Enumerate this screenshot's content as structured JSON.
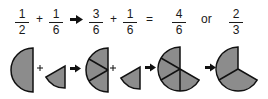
{
  "equation": {
    "terms": [
      {
        "numerator": "1",
        "denominator": "2"
      },
      {
        "numerator": "1",
        "denominator": "6"
      },
      {
        "numerator": "3",
        "denominator": "6"
      },
      {
        "numerator": "1",
        "denominator": "6"
      },
      {
        "numerator": "4",
        "denominator": "6"
      },
      {
        "numerator": "2",
        "denominator": "3"
      }
    ],
    "operators": {
      "plus_1": "+",
      "plus_2": "+",
      "equals": "=",
      "or_word": "or"
    }
  },
  "pictorial": {
    "plus_1": "+",
    "plus_2": "+",
    "shapes": [
      {
        "label": "one-half",
        "fraction": "1/2",
        "pieces": 1
      },
      {
        "label": "one-sixth",
        "fraction": "1/6",
        "pieces": 1
      },
      {
        "label": "three-sixths",
        "fraction": "3/6",
        "pieces": 3
      },
      {
        "label": "one-sixth",
        "fraction": "1/6",
        "pieces": 1
      },
      {
        "label": "four-sixths",
        "fraction": "4/6",
        "pieces": 4
      },
      {
        "label": "two-thirds",
        "fraction": "2/3",
        "pieces": 2
      }
    ]
  },
  "colors": {
    "fill": "#8c8c8c",
    "stroke": "#111111",
    "text": "#1a1a1a",
    "background": "#ffffff"
  }
}
